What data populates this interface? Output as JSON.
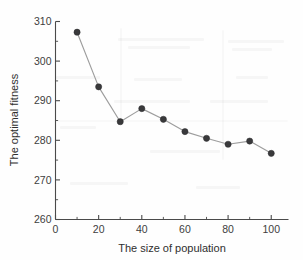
{
  "chart_data": {
    "type": "line",
    "title": "",
    "xlabel": "The size of population",
    "ylabel": "The optimal fitness",
    "x": [
      10,
      20,
      30,
      40,
      50,
      60,
      70,
      80,
      90,
      100
    ],
    "values": [
      307.3,
      293.5,
      284.7,
      288.0,
      285.3,
      282.2,
      280.5,
      279.0,
      279.8,
      276.7
    ],
    "series": [
      {
        "name": "optimal fitness",
        "values": [
          307.3,
          293.5,
          284.7,
          288.0,
          285.3,
          282.2,
          280.5,
          279.0,
          279.8,
          276.7
        ]
      }
    ],
    "xlim": [
      0,
      108
    ],
    "ylim": [
      260,
      310
    ],
    "xticks": [
      0,
      20,
      40,
      60,
      80,
      100
    ],
    "xticklabels": [
      "0",
      "20",
      "40",
      "60",
      "80",
      "100"
    ],
    "xminorticks": [
      10,
      30,
      50,
      70,
      90
    ],
    "yticks": [
      260,
      270,
      280,
      290,
      300,
      310
    ],
    "yticklabels": [
      "260",
      "270",
      "280",
      "290",
      "300",
      "310"
    ],
    "yminorticks": [
      265,
      275,
      285,
      295,
      305
    ],
    "grid": false,
    "legend": "none",
    "marker": "circle",
    "marker_color": "#39393b",
    "line_color": "#9d9d9d",
    "axis_color": "#4a4a4a"
  }
}
